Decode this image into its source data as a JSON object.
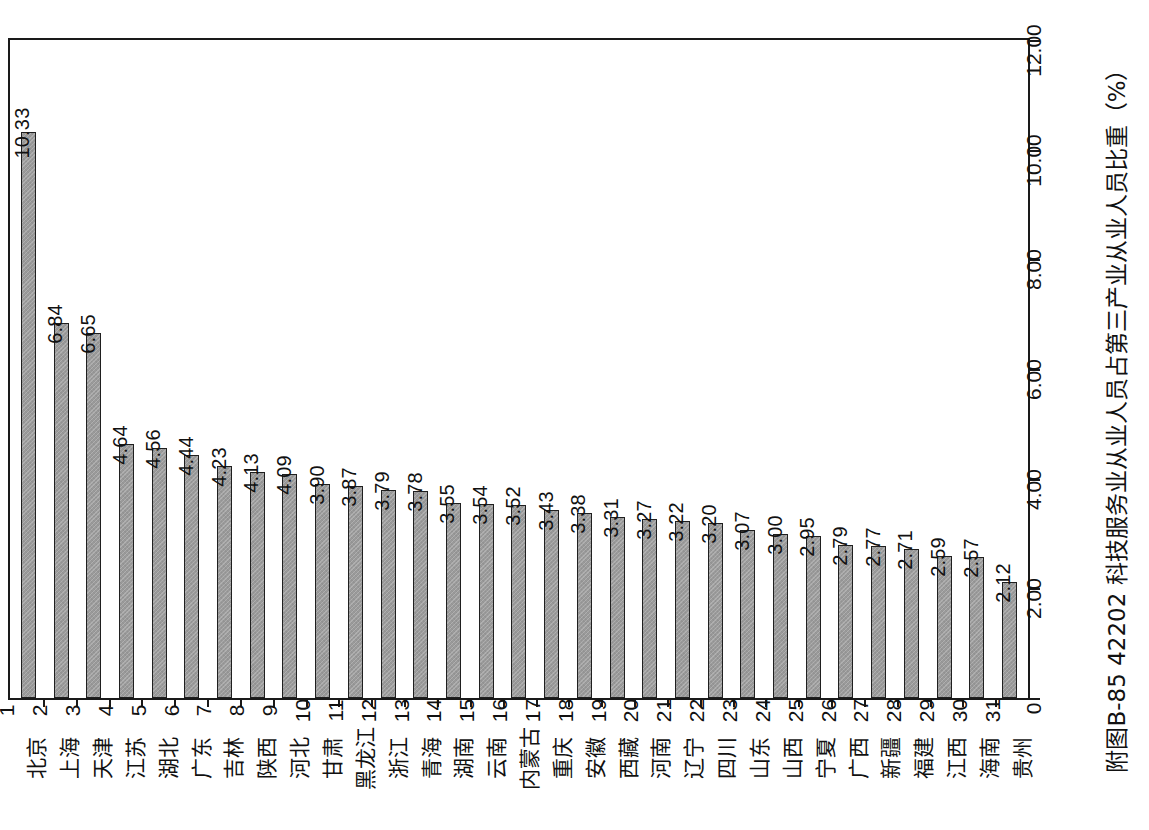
{
  "figure": {
    "caption": "附图B-85  42202 科技服务业从业人员占第三产业从业人员比重（%）",
    "caption_id": "附图B-85",
    "indicator_code": "42202",
    "indicator_name": "科技服务业从业人员占第三产业从业人员比重",
    "unit": "%",
    "orientation": "rotated-90-ccw",
    "bar_fill_color": "#9a9a9a",
    "bar_border_color": "#1f1f1f",
    "frame_color": "#1a1a1a",
    "background_color": "#ffffff"
  },
  "chart_data": {
    "type": "bar",
    "title": "附图B-85  42202 科技服务业从业人员占第三产业从业人员比重（%）",
    "xlabel": "",
    "ylabel": "42202 科技服务业从业人员占第三产业从业人员比重（%）",
    "ylim": [
      0,
      12
    ],
    "yticks": [
      0,
      2,
      4,
      6,
      8,
      10,
      12
    ],
    "ytick_labels": [
      "0",
      "2.00",
      "4.00",
      "6.00",
      "8.00",
      "10.00",
      "12.00"
    ],
    "grid": false,
    "legend": false,
    "ranks": [
      1,
      2,
      3,
      4,
      5,
      6,
      7,
      8,
      9,
      10,
      11,
      12,
      13,
      14,
      15,
      16,
      17,
      18,
      19,
      20,
      21,
      22,
      23,
      24,
      25,
      26,
      27,
      28,
      29,
      30,
      31
    ],
    "categories": [
      "北京",
      "上海",
      "天津",
      "江苏",
      "湖北",
      "广东",
      "吉林",
      "陕西",
      "河北",
      "甘肃",
      "黑龙江",
      "浙江",
      "青海",
      "湖南",
      "云南",
      "内蒙古",
      "重庆",
      "安徽",
      "西藏",
      "河南",
      "辽宁",
      "四川",
      "山东",
      "山西",
      "宁夏",
      "广西",
      "新疆",
      "福建",
      "江西",
      "海南",
      "贵州"
    ],
    "values": [
      10.33,
      6.84,
      6.65,
      4.64,
      4.56,
      4.44,
      4.23,
      4.13,
      4.09,
      3.9,
      3.87,
      3.79,
      3.78,
      3.55,
      3.54,
      3.52,
      3.43,
      3.38,
      3.31,
      3.27,
      3.22,
      3.2,
      3.07,
      3.0,
      2.95,
      2.79,
      2.77,
      2.71,
      2.59,
      2.57,
      2.12
    ],
    "value_labels": [
      "10.33",
      "6.84",
      "6.65",
      "4.64",
      "4.56",
      "4.44",
      "4.23",
      "4.13",
      "4.09",
      "3.90",
      "3.87",
      "3.79",
      "3.78",
      "3.55",
      "3.54",
      "3.52",
      "3.43",
      "3.38",
      "3.31",
      "3.27",
      "3.22",
      "3.20",
      "3.07",
      "3.00",
      "2.95",
      "2.79",
      "2.77",
      "2.71",
      "2.59",
      "2.57",
      "2.12"
    ]
  }
}
